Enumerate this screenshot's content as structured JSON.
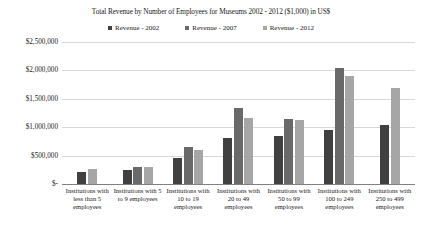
{
  "chart_data": {
    "type": "bar",
    "title": "Total Revenue by Number of Employees for Museums 2002 - 2012 ($1,000) in US$",
    "xlabel": "",
    "ylabel": "",
    "ylim": [
      0,
      2500000
    ],
    "grid": true,
    "legend_position": "top",
    "ytick_labels": [
      "$2,500,000",
      "$2,000,000",
      "$1,500,000",
      "$1,000,000",
      "$500,000",
      "$-"
    ],
    "ytick_values": [
      2500000,
      2000000,
      1500000,
      1000000,
      500000,
      0
    ],
    "categories": [
      "Institutions with less than 5 employees",
      "Institutions with 5 to 9 employees",
      "Institutions with 10 to 19 employees",
      "Institutions with 20 to 49 employees",
      "Institutions with 50 to 99 employees",
      "Institutions with 100 to 249 employees",
      "Institutions with 250 to 499 employees"
    ],
    "series": [
      {
        "name": "Revenue - 2002",
        "color": "#404040",
        "values": [
          210000,
          250000,
          460000,
          810000,
          845000,
          950000,
          1040000
        ]
      },
      {
        "name": "Revenue - 2007",
        "color": "#696969",
        "values": [
          null,
          300000,
          650000,
          1340000,
          1140000,
          2040000,
          null
        ]
      },
      {
        "name": "Revenue - 2012",
        "color": "#a6a6a6",
        "values": [
          265000,
          300000,
          600000,
          1160000,
          1130000,
          1900000,
          1690000
        ]
      }
    ]
  }
}
